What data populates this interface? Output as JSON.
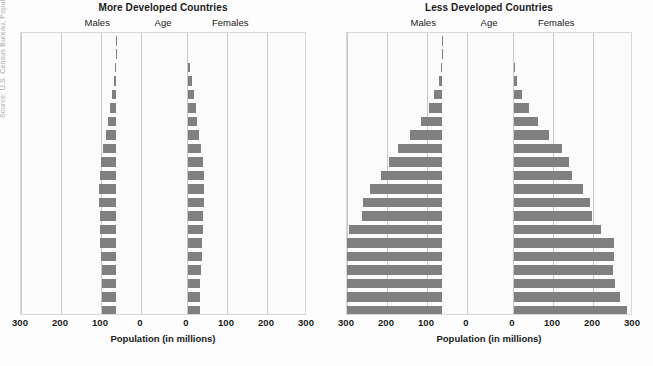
{
  "source_credit": "Source: U.S. Census Bureau, Population and Social Statistics",
  "axis": {
    "title": "Population (in millions)",
    "ticks": [
      300,
      200,
      100,
      0,
      0,
      100,
      200,
      300
    ],
    "max": 300
  },
  "headers": {
    "males": "Males",
    "age": "Age",
    "females": "Females"
  },
  "age_groups": [
    "100+",
    "95–99",
    "90–94",
    "85–89",
    "80–84",
    "75–79",
    "70–74",
    "65–69",
    "60–64",
    "55–59",
    "50–54",
    "45–49",
    "40–44",
    "35–39",
    "30–34",
    "25–29",
    "20–24",
    "15–19",
    "10–14",
    "5–9",
    "0–4"
  ],
  "colors": {
    "bar": "#808080",
    "gridline": "#c9c9c9",
    "plot_background": "#fbfbfb",
    "frame": "#d8d8d8",
    "text": "#1a1a1a"
  },
  "chart_data": [
    {
      "type": "bar",
      "title": "More Developed Countries",
      "xlabel": "Population (in millions)",
      "ylabel": "Age",
      "xlim": [
        -300,
        300
      ],
      "grid": true,
      "categories": [
        "100+",
        "95–99",
        "90–94",
        "85–89",
        "80–84",
        "75–79",
        "70–74",
        "65–69",
        "60–64",
        "55–59",
        "50–54",
        "45–49",
        "40–44",
        "35–39",
        "30–34",
        "25–29",
        "20–24",
        "15–19",
        "10–14",
        "5–9",
        "0–4"
      ],
      "series": [
        {
          "name": "Males",
          "values": [
            0.2,
            1,
            3,
            6,
            11,
            16,
            20,
            26,
            32,
            37,
            41,
            42,
            42,
            40,
            40,
            39,
            38,
            36,
            35,
            34,
            34
          ]
        },
        {
          "name": "Females",
          "values": [
            0.8,
            3,
            7,
            12,
            18,
            23,
            26,
            31,
            35,
            39,
            42,
            43,
            43,
            40,
            40,
            38,
            37,
            34,
            33,
            32,
            32
          ]
        }
      ]
    },
    {
      "type": "bar",
      "title": "Less Developed Countries",
      "xlabel": "Population (in millions)",
      "ylabel": "Age",
      "xlim": [
        -300,
        300
      ],
      "grid": true,
      "categories": [
        "100+",
        "95–99",
        "90–94",
        "85–89",
        "80–84",
        "75–79",
        "70–74",
        "65–69",
        "60–64",
        "55–59",
        "50–54",
        "45–49",
        "40–44",
        "35–39",
        "30–34",
        "25–29",
        "20–24",
        "15–19",
        "10–14",
        "5–9",
        "0–4"
      ],
      "series": [
        {
          "name": "Males",
          "values": [
            0.2,
            1,
            3,
            8,
            19,
            33,
            53,
            79,
            110,
            132,
            152,
            180,
            197,
            200,
            233,
            265,
            270,
            265,
            272,
            285,
            300
          ]
        },
        {
          "name": "Females",
          "values": [
            0.5,
            2,
            5,
            11,
            23,
            40,
            62,
            90,
            122,
            141,
            148,
            175,
            192,
            198,
            220,
            252,
            253,
            250,
            256,
            268,
            285
          ]
        }
      ]
    }
  ]
}
